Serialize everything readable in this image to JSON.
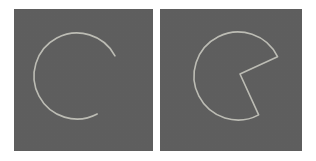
{
  "figure": {
    "title": "",
    "background_color": "#ffffff",
    "panel_count": 2,
    "panel_background_color": "#5e5e5e",
    "stroke_color": "#bcbcb4",
    "stroke_width": 1.6
  },
  "panels": [
    {
      "id": "panel-left",
      "name": "open-arc-panel",
      "label": "",
      "shape_type": "arc",
      "description": "incomplete circular outline with an open gap on the right side",
      "background_color": "#5e5e5e",
      "stroke_color": "#bcbcb4",
      "geometry": {
        "center_x": 63,
        "center_y": 67,
        "radius": 43,
        "start_angle_deg": -28,
        "end_angle_deg": 62,
        "sweep_deg": 270,
        "closed": false,
        "endpoint_start": {
          "x": 101,
          "y": 47
        },
        "endpoint_end": {
          "x": 83,
          "y": 105
        }
      }
    },
    {
      "id": "panel-right",
      "name": "pacman-sector-panel",
      "label": "",
      "shape_type": "circular-sector-outline",
      "description": "circle outline with a wedge removed, forming a pac-man silhouette closed by two radii",
      "background_color": "#5e5e5e",
      "stroke_color": "#bcbcb4",
      "geometry": {
        "center_x": 78,
        "center_y": 67,
        "radius": 44,
        "start_angle_deg": -26,
        "end_angle_deg": 62,
        "sweep_deg": 272,
        "closed": true,
        "wedge_vertex": {
          "x": 80,
          "y": 65
        },
        "endpoint_start": {
          "x": 118,
          "y": 48
        },
        "endpoint_end": {
          "x": 99,
          "y": 106
        }
      }
    }
  ]
}
